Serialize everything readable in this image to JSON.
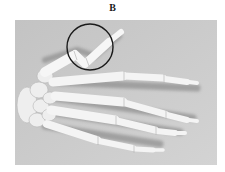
{
  "figure": {
    "label": "B",
    "colors": {
      "background": "#ffffff",
      "photo_background": "#c9c9c9",
      "bone": "#f3f3f3",
      "bone_shadow": "#9a9a9a",
      "annotation_circle": "#1a1a1a"
    },
    "annotation": {
      "shape": "circle",
      "target": "thumb",
      "center_px": [
        90,
        47
      ],
      "radius_px": 23
    }
  }
}
